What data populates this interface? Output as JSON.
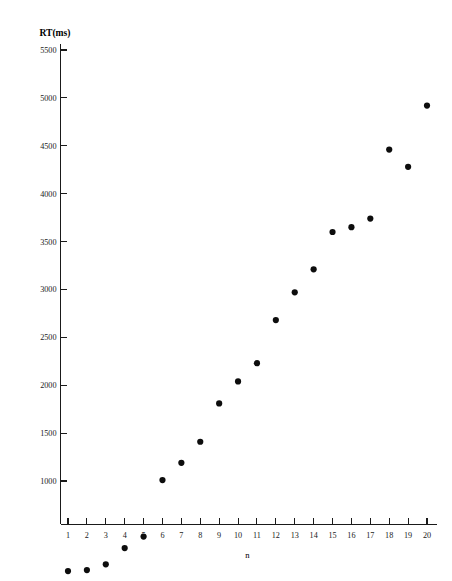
{
  "figure": {
    "background_color": "#ffffff",
    "marker_color": "#0d0d0d",
    "axis_color": "#1a1a1a"
  },
  "chart_data": {
    "type": "scatter",
    "title": "",
    "subtitle": "",
    "xlabel": "n",
    "ylabel": "RT(ms)",
    "ylabel_position": "top-left-horizontal",
    "grid": false,
    "legend": false,
    "legend_position": "none",
    "xlim": [
      0.5,
      20.5
    ],
    "ylim": [
      0,
      5600
    ],
    "x": [
      1,
      2,
      3,
      4,
      5,
      6,
      7,
      8,
      9,
      10,
      11,
      12,
      13,
      14,
      15,
      16,
      17,
      18,
      19,
      20
    ],
    "values": [
      60,
      70,
      130,
      300,
      420,
      1010,
      1190,
      1410,
      1810,
      2040,
      2230,
      2680,
      2970,
      3210,
      3600,
      3650,
      3740,
      4460,
      4280,
      4920
    ],
    "xticks": [
      1,
      2,
      3,
      4,
      5,
      6,
      7,
      8,
      9,
      10,
      11,
      12,
      13,
      14,
      15,
      16,
      17,
      18,
      19,
      20
    ],
    "xticklabels": [
      "1",
      "2",
      "3",
      "4",
      "5",
      "6",
      "7",
      "8",
      "9",
      "10",
      "11",
      "12",
      "13",
      "14",
      "15",
      "16",
      "17",
      "18",
      "19",
      "20"
    ],
    "yticks": [
      1000,
      1500,
      2000,
      2500,
      3000,
      3500,
      4000,
      4500,
      5000,
      5500
    ],
    "yticklabels": [
      "1000",
      "1500",
      "2000",
      "2500",
      "3000",
      "3500",
      "4000",
      "4500",
      "5000",
      "5500"
    ],
    "points": [
      {
        "n": 1,
        "rt": 60
      },
      {
        "n": 2,
        "rt": 70
      },
      {
        "n": 3,
        "rt": 130
      },
      {
        "n": 4,
        "rt": 300
      },
      {
        "n": 5,
        "rt": 420
      },
      {
        "n": 6,
        "rt": 1010
      },
      {
        "n": 7,
        "rt": 1190
      },
      {
        "n": 8,
        "rt": 1410
      },
      {
        "n": 9,
        "rt": 1810
      },
      {
        "n": 10,
        "rt": 2040
      },
      {
        "n": 11,
        "rt": 2230
      },
      {
        "n": 12,
        "rt": 2680
      },
      {
        "n": 13,
        "rt": 2970
      },
      {
        "n": 14,
        "rt": 3210
      },
      {
        "n": 15,
        "rt": 3600
      },
      {
        "n": 16,
        "rt": 3650
      },
      {
        "n": 17,
        "rt": 3740
      },
      {
        "n": 18,
        "rt": 4460
      },
      {
        "n": 19,
        "rt": 4280
      },
      {
        "n": 20,
        "rt": 4920
      }
    ]
  }
}
